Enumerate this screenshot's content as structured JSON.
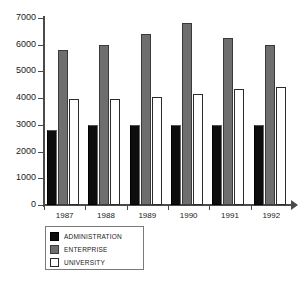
{
  "chart_data": {
    "type": "bar",
    "title": "",
    "xlabel": "",
    "ylabel": "",
    "categories": [
      "1987",
      "1988",
      "1989",
      "1990",
      "1991",
      "1992"
    ],
    "series": [
      {
        "name": "ADMINISTRATION",
        "color": "#0d0d0d",
        "values": [
          2800,
          2980,
          2980,
          2980,
          2980,
          2980
        ]
      },
      {
        "name": "ENTERPRISE",
        "color": "#6e6e6e",
        "values": [
          5800,
          6000,
          6400,
          6800,
          6250,
          6000
        ]
      },
      {
        "name": "UNIVERSITY",
        "color": "#ffffff",
        "values": [
          3950,
          3950,
          4050,
          4150,
          4350,
          4400
        ]
      }
    ],
    "ylim": [
      0,
      7000
    ],
    "yticks": [
      0,
      1000,
      2000,
      3000,
      4000,
      5000,
      6000,
      7000
    ],
    "ytick_labels": [
      "0",
      "1000",
      "2000",
      "3000",
      "4000",
      "5000",
      "6000",
      "7000"
    ],
    "grid": false,
    "legend_position": "below-left",
    "legend": [
      "ADMINISTRATION",
      "ENTERPRISE",
      "UNIVERSITY"
    ]
  }
}
